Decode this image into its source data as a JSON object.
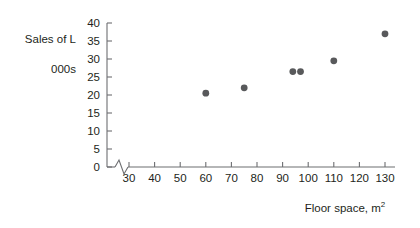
{
  "chart_data": {
    "type": "scatter",
    "title": "",
    "xlabel": "Floor space, m2",
    "xlabel_base": "Floor space, m",
    "xlabel_exponent": "2",
    "ylabel": "Sales of L\n000s",
    "ylabel_line1": "Sales of L",
    "ylabel_line2": "000s",
    "xlim": [
      25,
      135
    ],
    "ylim": [
      0,
      40
    ],
    "x_ticks": [
      30,
      40,
      50,
      60,
      70,
      80,
      90,
      100,
      110,
      120,
      130
    ],
    "y_ticks": [
      0,
      5,
      10,
      15,
      20,
      25,
      30,
      35,
      40
    ],
    "x_tick_labels": [
      "30",
      "40",
      "50",
      "60",
      "70",
      "80",
      "90",
      "100",
      "110",
      "120",
      "130"
    ],
    "y_tick_labels": [
      "0",
      "5",
      "10",
      "15",
      "20",
      "25",
      "30",
      "35",
      "40"
    ],
    "grid": false,
    "legend": false,
    "axis_break": true,
    "axis_break_note": "zigzag break on x-axis between origin and first tick",
    "marker_color": "#58595b",
    "axis_color": "#6d6e71",
    "background": "#ffffff",
    "points": [
      {
        "x": 60,
        "y": 20.5
      },
      {
        "x": 75,
        "y": 22.0
      },
      {
        "x": 94,
        "y": 26.5
      },
      {
        "x": 97,
        "y": 26.5
      },
      {
        "x": 110,
        "y": 29.5
      },
      {
        "x": 130,
        "y": 37.0
      }
    ]
  }
}
